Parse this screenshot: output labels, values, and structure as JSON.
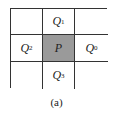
{
  "diagram": {
    "type": "3x3 neighborhood grid",
    "cells": [
      {
        "row": 0,
        "col": 0,
        "label": "",
        "sub": ""
      },
      {
        "row": 0,
        "col": 1,
        "label": "Q",
        "sub": "1"
      },
      {
        "row": 0,
        "col": 2,
        "label": "",
        "sub": ""
      },
      {
        "row": 1,
        "col": 0,
        "label": "Q",
        "sub": "2"
      },
      {
        "row": 1,
        "col": 1,
        "label": "P",
        "sub": ""
      },
      {
        "row": 1,
        "col": 2,
        "label": "Q",
        "sub": "0"
      },
      {
        "row": 2,
        "col": 0,
        "label": "",
        "sub": ""
      },
      {
        "row": 2,
        "col": 1,
        "label": "Q",
        "sub": "3"
      },
      {
        "row": 2,
        "col": 2,
        "label": "",
        "sub": ""
      }
    ],
    "center_color": "#9a9a9a",
    "caption": "(a)"
  }
}
